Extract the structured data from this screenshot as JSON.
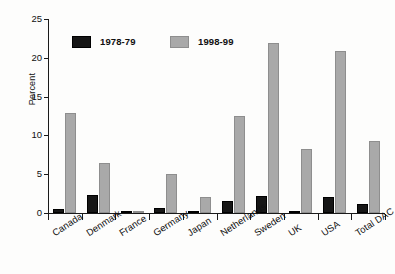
{
  "chart_data": {
    "type": "bar",
    "title": "",
    "subtitle": "",
    "xlabel": "",
    "ylabel": "Percent",
    "ylim": [
      0,
      25
    ],
    "yticks": [
      0,
      5,
      10,
      15,
      20,
      25
    ],
    "grid": false,
    "legend_position": "top-left-inside",
    "categories": [
      "Canada",
      "Denmark",
      "France",
      "Germany",
      "Japan",
      "Netherlands",
      "Sweden",
      "UK",
      "USA",
      "Total DAC"
    ],
    "series": [
      {
        "name": "1978-79",
        "color": "#161616",
        "values": [
          0.5,
          2.3,
          0.2,
          0.7,
          0.2,
          1.6,
          2.2,
          0.2,
          2.1,
          1.1
        ]
      },
      {
        "name": "1998-99",
        "color": "#a9a9a9",
        "values": [
          12.9,
          6.4,
          0.2,
          5.0,
          2.0,
          12.5,
          21.9,
          8.3,
          20.9,
          9.3
        ]
      }
    ]
  },
  "axis": {
    "y_label": "Percent",
    "y_tick_labels": [
      "25",
      "20",
      "15",
      "10",
      "5",
      "0"
    ]
  },
  "legend": {
    "entries": [
      {
        "label": "1978-79",
        "swatch": "black-square-icon"
      },
      {
        "label": "1998-99",
        "swatch": "gray-square-icon"
      }
    ]
  }
}
